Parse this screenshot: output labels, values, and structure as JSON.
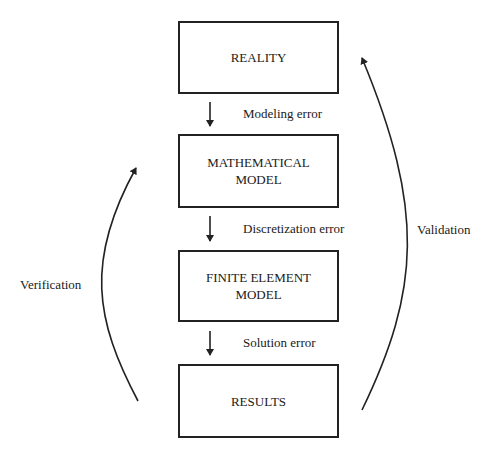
{
  "diagram": {
    "boxes": [
      {
        "id": "reality",
        "lines": [
          "REALITY"
        ]
      },
      {
        "id": "mathematical-model",
        "lines": [
          "MATHEMATICAL",
          "MODEL"
        ]
      },
      {
        "id": "finite-element-model",
        "lines": [
          "FINITE ELEMENT",
          "MODEL"
        ]
      },
      {
        "id": "results",
        "lines": [
          "RESULTS"
        ]
      }
    ],
    "errors": [
      {
        "label": "Modeling error"
      },
      {
        "label": "Discretization error"
      },
      {
        "label": "Solution error"
      }
    ],
    "loops": {
      "left": {
        "label": "Verification"
      },
      "right": {
        "label": "Validation"
      }
    },
    "colors": {
      "stroke": "#222222",
      "text": "#1a1a1a",
      "background": "#ffffff"
    }
  }
}
